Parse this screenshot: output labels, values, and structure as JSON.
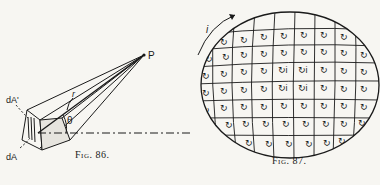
{
  "figures": [
    {
      "id": "fig86",
      "caption": "Fig. 86.",
      "labels": {
        "point": "P",
        "radius": "r",
        "angle": "θ",
        "area_projected": "dA'",
        "area": "dA"
      }
    },
    {
      "id": "fig87",
      "caption": "Fig. 87.",
      "labels": {
        "current": "i",
        "inner_current": "i"
      }
    }
  ]
}
